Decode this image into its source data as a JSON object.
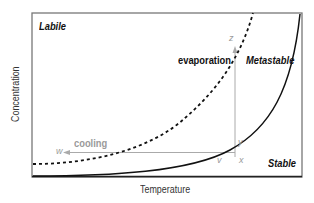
{
  "diagram": {
    "axes": {
      "x_label": "Temperature",
      "y_label": "Concentration"
    },
    "regions": {
      "labile": "Labile",
      "metastable": "Metastable",
      "stable": "Stable"
    },
    "processes": {
      "evaporation": "evaporation",
      "cooling": "cooling"
    },
    "points": {
      "v": "v",
      "w": "w",
      "x": "x",
      "y": "y",
      "z": "z"
    },
    "curves": [
      {
        "name": "supersolubility",
        "style": "dashed",
        "color": "#111111"
      },
      {
        "name": "solubility",
        "style": "solid",
        "color": "#111111"
      }
    ],
    "colors": {
      "frame": "#777777",
      "curve": "#111111",
      "path_arrows": "#aaaaaa",
      "evaporation_text": "#111111",
      "cooling_text": "#9a9a9a"
    }
  }
}
